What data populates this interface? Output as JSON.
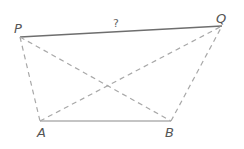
{
  "diagram": {
    "points": {
      "P": {
        "label": "P",
        "x": 20,
        "y": 37,
        "lx": 14,
        "ly": 32
      },
      "Q": {
        "label": "Q",
        "x": 222,
        "y": 26,
        "lx": 216,
        "ly": 22
      },
      "A": {
        "label": "A",
        "x": 40,
        "y": 121,
        "lx": 38,
        "ly": 137
      },
      "B": {
        "label": "B",
        "x": 171,
        "y": 121,
        "lx": 166,
        "ly": 137
      }
    },
    "unknown_label": "?",
    "solid_color": "#777777",
    "dashed_color": "#aaaaaa",
    "segments": [
      {
        "from": "P",
        "to": "Q",
        "style": "solid"
      },
      {
        "from": "A",
        "to": "B",
        "style": "solid"
      },
      {
        "from": "P",
        "to": "A",
        "style": "dashed"
      },
      {
        "from": "P",
        "to": "B",
        "style": "dashed"
      },
      {
        "from": "A",
        "to": "Q",
        "style": "dashed"
      },
      {
        "from": "B",
        "to": "Q",
        "style": "dashed"
      }
    ]
  }
}
